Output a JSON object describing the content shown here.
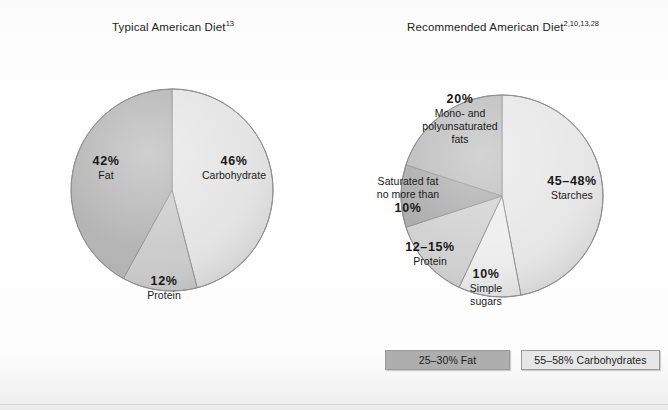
{
  "figure": {
    "background_color": "#fdfdfd",
    "charts": [
      {
        "title_main": "Typical American Diet",
        "title_superscript": "13"
      },
      {
        "title_main": "Recommended American Diet",
        "title_superscript": "2,10,13,28"
      }
    ]
  },
  "legend": {
    "items": [
      {
        "label": "25–30% Fat",
        "color": "#aeaeae"
      },
      {
        "label": "55–58% Carbohydrates",
        "color": "#e6e6e6"
      }
    ]
  },
  "chart_data": [
    {
      "type": "pie",
      "title": "Typical American Diet 13",
      "categories": [
        "Carbohydrate",
        "Protein",
        "Fat"
      ],
      "values": [
        46,
        12,
        42
      ],
      "value_labels": [
        "46%",
        "12%",
        "42%"
      ],
      "colors": [
        "#e3e3e3",
        "#c9c9c9",
        "#b0b0b0"
      ],
      "start_angle_deg": 0,
      "direction": "clockwise",
      "units": "percent of total calories",
      "legend": "none",
      "grid": false
    },
    {
      "type": "pie",
      "title": "Recommended American Diet 2,10,13,28",
      "categories": [
        "Starches",
        "Simple sugars",
        "Protein",
        "Saturated fat",
        "Mono- and polyunsaturated fats"
      ],
      "values": [
        47,
        10,
        13,
        10,
        20
      ],
      "value_labels": [
        "45–48%",
        "10%",
        "12–15%",
        "10%",
        "20%"
      ],
      "colors": [
        "#e6e6e6",
        "#ededed",
        "#cfcfcf",
        "#a8a8a8",
        "#b8b8b8"
      ],
      "start_angle_deg": 0,
      "direction": "clockwise",
      "units": "percent of total calories",
      "legend": "bottom-right",
      "grid": false
    }
  ],
  "labels": {
    "left": [
      {
        "pct": "46%",
        "name": "Carbohydrate"
      },
      {
        "pct": "12%",
        "name": "Protein"
      },
      {
        "pct": "42%",
        "name": "Fat"
      }
    ],
    "right": [
      {
        "pct": "45–48%",
        "name": "Starches"
      },
      {
        "pct": "10%",
        "name_line1": "Simple",
        "name_line2": "sugars"
      },
      {
        "pct": "12–15%",
        "name": "Protein"
      },
      {
        "pct": "10%",
        "name_line1": "Saturated fat",
        "name_line2": "no more than"
      },
      {
        "pct": "20%",
        "name_line1": "Mono- and",
        "name_line2": "polyunsaturated",
        "name_line3": "fats"
      }
    ]
  }
}
